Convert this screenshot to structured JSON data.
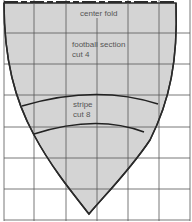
{
  "diagram": {
    "labels": {
      "center_fold": "center fold",
      "football_section_line1": "football section",
      "football_section_line2": "cut 4",
      "stripe_line1": "stripe",
      "stripe_line2": "cut 8"
    },
    "colors": {
      "fill": "#d4d4d4",
      "outline": "#2a2a2a",
      "grid": "#555555",
      "background": "#ffffff"
    },
    "grid": {
      "vertical_x": [
        4,
        34,
        66,
        97,
        128,
        159,
        190
      ],
      "horizontal_y": [
        33,
        64,
        95,
        127,
        158,
        189,
        220
      ]
    }
  }
}
